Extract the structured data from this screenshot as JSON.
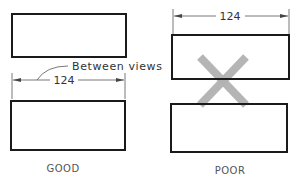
{
  "figure": {
    "good": {
      "caption": "GOOD",
      "dimension_value": "124",
      "note": "Between views",
      "description": "Dimension placed between the two views"
    },
    "poor": {
      "caption": "POOR",
      "dimension_value": "124",
      "description": "Dimension placed above the top view, crossed out",
      "mark": "x-mark"
    }
  },
  "colors": {
    "outline": "#1a1a1a",
    "dimension_line": "#555555",
    "x_mark": "#b2b2b2"
  }
}
